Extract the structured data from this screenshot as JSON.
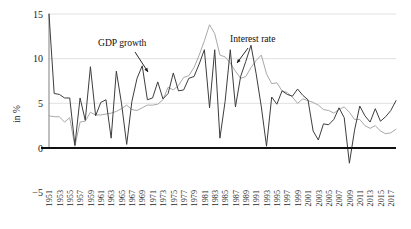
{
  "chart_data": {
    "type": "line",
    "title": "",
    "subtitle": "",
    "xlabel": "",
    "ylabel": "in %",
    "ylim": [
      -5,
      15
    ],
    "xlim": [
      1951,
      2018
    ],
    "yticks": [
      15,
      10,
      5,
      0,
      -5
    ],
    "ytick_labels": [
      "15",
      "10",
      "5",
      "0",
      "−5"
    ],
    "grid": true,
    "grid_axis": "y",
    "legend": "inline-annotations",
    "zero_line": true,
    "x": [
      1951,
      1952,
      1953,
      1954,
      1955,
      1956,
      1957,
      1958,
      1959,
      1960,
      1961,
      1962,
      1963,
      1964,
      1965,
      1966,
      1967,
      1968,
      1969,
      1970,
      1971,
      1972,
      1973,
      1974,
      1975,
      1976,
      1977,
      1978,
      1979,
      1980,
      1981,
      1982,
      1983,
      1984,
      1985,
      1986,
      1987,
      1988,
      1989,
      1990,
      1991,
      1992,
      1993,
      1994,
      1995,
      1996,
      1997,
      1998,
      1999,
      2000,
      2001,
      2002,
      2003,
      2004,
      2005,
      2006,
      2007,
      2008,
      2009,
      2010,
      2011,
      2012,
      2013,
      2014,
      2015,
      2016,
      2017,
      2018
    ],
    "xtick_labels": [
      "1951",
      "1953",
      "1955",
      "1957",
      "1959",
      "1961",
      "1963",
      "1965",
      "1967",
      "1969",
      "1971",
      "1973",
      "1975",
      "1977",
      "1979",
      "1981",
      "1983",
      "1985",
      "1987",
      "1989",
      "1991",
      "1993",
      "1995",
      "1997",
      "1999",
      "2001",
      "2003",
      "2005",
      "2007",
      "2009",
      "2011",
      "2013",
      "2015",
      "2017"
    ],
    "xtick_step": 2,
    "series": [
      {
        "name": "GDP growth",
        "color": "#3d3d3d",
        "values": [
          15.0,
          6.1,
          6.0,
          5.6,
          5.6,
          0.3,
          5.6,
          3.1,
          9.1,
          3.6,
          5.1,
          5.4,
          1.1,
          8.6,
          5.0,
          0.4,
          5.2,
          7.8,
          9.2,
          5.4,
          5.6,
          7.4,
          5.5,
          6.1,
          8.4,
          6.4,
          6.5,
          7.8,
          8.0,
          9.4,
          11.0,
          4.5,
          11.0,
          1.1,
          5.2,
          11.0,
          4.6,
          8.0,
          9.7,
          11.5,
          8.3,
          4.6,
          0.2,
          5.7,
          4.9,
          6.4,
          6.0,
          5.8,
          6.6,
          5.9,
          5.4,
          1.9,
          0.9,
          2.7,
          2.6,
          3.2,
          4.5,
          3.4,
          -1.7,
          2.0,
          4.7,
          3.6,
          2.9,
          4.4,
          3.0,
          3.5,
          4.2,
          5.3
        ]
      },
      {
        "name": "Interest rate",
        "color": "#a8a8a8",
        "values": [
          3.6,
          3.5,
          3.5,
          2.9,
          3.4,
          0.2,
          2.9,
          3.0,
          4.0,
          3.7,
          3.7,
          3.8,
          3.9,
          4.1,
          4.4,
          4.8,
          4.3,
          4.2,
          4.5,
          4.8,
          4.8,
          4.9,
          5.4,
          6.8,
          6.5,
          7.0,
          7.9,
          8.1,
          9.0,
          10.4,
          12.0,
          13.8,
          12.8,
          10.4,
          10.2,
          9.5,
          8.6,
          7.8,
          8.0,
          9.0,
          9.8,
          10.4,
          8.3,
          7.2,
          7.3,
          6.4,
          6.2,
          5.7,
          5.0,
          5.5,
          5.3,
          5.1,
          4.8,
          4.3,
          4.2,
          3.9,
          4.3,
          4.6,
          4.0,
          3.2,
          3.2,
          2.5,
          2.2,
          2.5,
          1.9,
          1.6,
          1.7,
          2.1
        ]
      }
    ],
    "annotations": [
      {
        "name": "gdp-growth-annotation",
        "text": "GDP growth",
        "x": 98,
        "y": 46,
        "arrow_from": [
          135,
          52
        ],
        "arrow_to": [
          148,
          72
        ]
      },
      {
        "name": "interest-rate-annotation",
        "text": "Interest rate",
        "x": 230,
        "y": 42,
        "arrow_from": [
          248,
          48
        ],
        "arrow_to": [
          237,
          63
        ]
      }
    ]
  }
}
